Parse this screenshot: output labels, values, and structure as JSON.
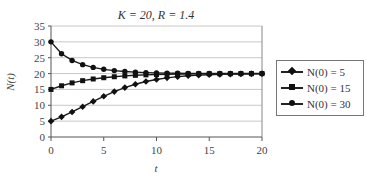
{
  "chart_data": {
    "type": "line",
    "title": "K = 20, R = 1.4",
    "xlabel": "t",
    "ylabel": "N(t)",
    "xlim": [
      0,
      20
    ],
    "ylim": [
      0,
      35
    ],
    "xticks": [
      0,
      5,
      10,
      15,
      20
    ],
    "yticks": [
      0,
      5,
      10,
      15,
      20,
      25,
      30,
      35
    ],
    "grid": "horizontal",
    "legend_position": "right",
    "x": [
      0,
      1,
      2,
      3,
      4,
      5,
      6,
      7,
      8,
      9,
      10,
      11,
      12,
      13,
      14,
      15,
      16,
      17,
      18,
      19,
      20
    ],
    "series": [
      {
        "name": "N(0) = 5",
        "marker": "diamond",
        "values": [
          5,
          6.36,
          7.9,
          9.55,
          11.23,
          12.84,
          14.31,
          15.58,
          16.64,
          17.49,
          18.15,
          18.65,
          19.03,
          19.3,
          19.5,
          19.64,
          19.74,
          19.82,
          19.87,
          19.91,
          19.93
        ]
      },
      {
        "name": "N(0) = 15",
        "marker": "square",
        "values": [
          15,
          16.15,
          17.06,
          17.76,
          18.29,
          18.69,
          19.0,
          19.26,
          19.45,
          19.59,
          19.7,
          19.78,
          19.84,
          19.88,
          19.91,
          19.94,
          19.95,
          19.97,
          19.98,
          19.98,
          19.99
        ]
      },
      {
        "name": "N(0) = 30",
        "marker": "circle",
        "values": [
          30,
          26.25,
          24.14,
          22.82,
          21.94,
          21.34,
          20.93,
          20.64,
          20.45,
          20.31,
          20.22,
          20.15,
          20.1,
          20.07,
          20.05,
          20.04,
          20.03,
          20.02,
          20.01,
          20.01,
          20.01
        ]
      }
    ]
  },
  "legend": {
    "items": [
      {
        "label": "N(0) = 5"
      },
      {
        "label": "N(0) = 15"
      },
      {
        "label": "N(0) = 30"
      }
    ]
  }
}
